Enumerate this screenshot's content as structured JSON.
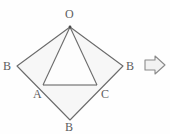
{
  "figure": {
    "type": "geometry-diagram",
    "background_color": "#fefefe",
    "stroke_color": "#6b6b6b",
    "fill_color": "#f7f7f7",
    "labels": {
      "top": "O",
      "left": "B",
      "right": "B",
      "bottom": "B",
      "inner_left": "A",
      "inner_right": "C"
    },
    "points": {
      "O": {
        "x": 70,
        "y": 27
      },
      "B_left": {
        "x": 17,
        "y": 66
      },
      "B_right": {
        "x": 123,
        "y": 66
      },
      "B_bottom": {
        "x": 70,
        "y": 120
      },
      "A": {
        "x": 43,
        "y": 85
      },
      "C": {
        "x": 97,
        "y": 85
      }
    },
    "segments": [
      {
        "name": "O-B_left",
        "from": "O",
        "to": "B_left"
      },
      {
        "name": "O-B_right",
        "from": "O",
        "to": "B_right"
      },
      {
        "name": "B_left-B_bottom",
        "from": "B_left",
        "to": "B_bottom"
      },
      {
        "name": "B_right-B_bottom",
        "from": "B_right",
        "to": "B_bottom"
      },
      {
        "name": "O-A",
        "from": "O",
        "to": "A"
      },
      {
        "name": "O-C",
        "from": "O",
        "to": "C"
      },
      {
        "name": "A-C",
        "from": "A",
        "to": "C"
      }
    ],
    "arrow": {
      "icon": "arrow-right-icon",
      "direction": "right",
      "stroke_color": "#8a8a8a",
      "fill_color": "#f2f2f2"
    }
  }
}
